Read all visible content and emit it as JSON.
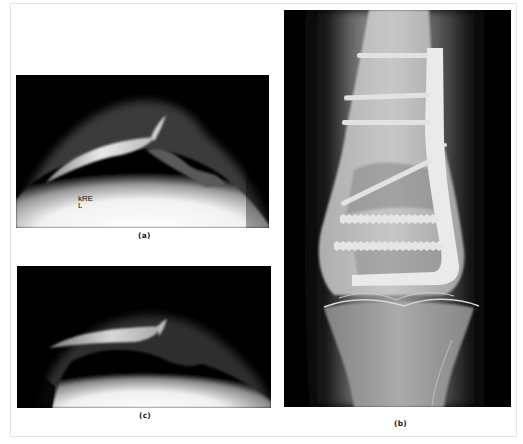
{
  "figure": {
    "panels": [
      {
        "id": "a",
        "caption": "(a)",
        "description": "Lateral/axial knee radiograph with overlying marker",
        "marker_line1": "kRE",
        "marker_line2": "L"
      },
      {
        "id": "b",
        "caption": "(b)",
        "description": "AP radiograph of distal femur with lateral plate and screws fixation"
      },
      {
        "id": "c",
        "caption": "(c)",
        "description": "Lateral/axial knee radiograph"
      }
    ],
    "colors": {
      "background": "#ffffff",
      "frame_border": "#e4e4e4",
      "film_black": "#000000",
      "caption_text": "#222222"
    }
  }
}
